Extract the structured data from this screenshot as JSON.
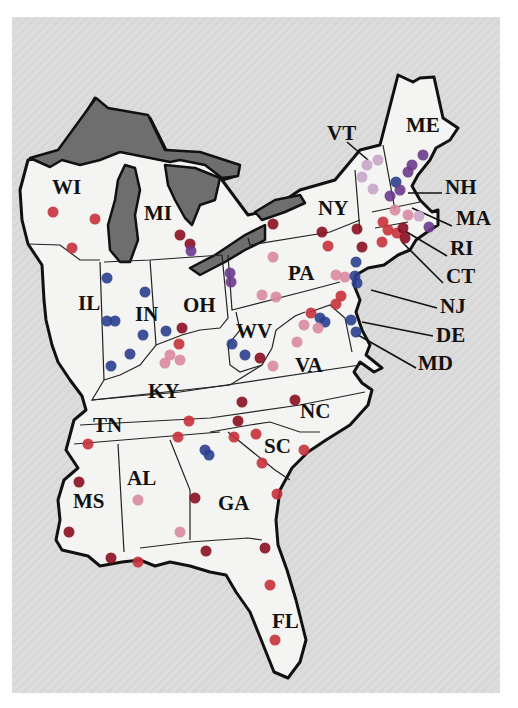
{
  "map": {
    "title": "",
    "region": "Eastern United States",
    "colors": {
      "background": "#d9d9d9",
      "land": "#f4f4f2",
      "lakes": "#6e6e6e",
      "outline": "#111111"
    },
    "dot_categories": [
      {
        "name": "dark-red",
        "color": "#8b1020"
      },
      {
        "name": "red",
        "color": "#c8313a"
      },
      {
        "name": "purple",
        "color": "#6a3a8c"
      },
      {
        "name": "blue",
        "color": "#2b3f8f"
      },
      {
        "name": "pink",
        "color": "#d98aa0"
      },
      {
        "name": "lavender",
        "color": "#c9a5c9"
      }
    ],
    "state_labels": [
      {
        "code": "WI",
        "x": 52,
        "y": 194
      },
      {
        "code": "MI",
        "x": 144,
        "y": 220
      },
      {
        "code": "VT",
        "x": 327,
        "y": 140
      },
      {
        "code": "ME",
        "x": 406,
        "y": 132
      },
      {
        "code": "NY",
        "x": 318,
        "y": 215
      },
      {
        "code": "NH",
        "x": 445,
        "y": 194
      },
      {
        "code": "MA",
        "x": 456,
        "y": 225
      },
      {
        "code": "PA",
        "x": 288,
        "y": 280
      },
      {
        "code": "RI",
        "x": 450,
        "y": 255
      },
      {
        "code": "CT",
        "x": 446,
        "y": 283
      },
      {
        "code": "IL",
        "x": 78,
        "y": 310
      },
      {
        "code": "IN",
        "x": 135,
        "y": 321
      },
      {
        "code": "OH",
        "x": 183,
        "y": 312
      },
      {
        "code": "NJ",
        "x": 440,
        "y": 313
      },
      {
        "code": "WV",
        "x": 236,
        "y": 338
      },
      {
        "code": "DE",
        "x": 436,
        "y": 342
      },
      {
        "code": "VA",
        "x": 295,
        "y": 372
      },
      {
        "code": "MD",
        "x": 418,
        "y": 370
      },
      {
        "code": "KY",
        "x": 148,
        "y": 398
      },
      {
        "code": "TN",
        "x": 93,
        "y": 432
      },
      {
        "code": "NC",
        "x": 300,
        "y": 418
      },
      {
        "code": "SC",
        "x": 264,
        "y": 453
      },
      {
        "code": "AL",
        "x": 127,
        "y": 485
      },
      {
        "code": "MS",
        "x": 73,
        "y": 508
      },
      {
        "code": "GA",
        "x": 218,
        "y": 510
      },
      {
        "code": "FL",
        "x": 272,
        "y": 628
      }
    ],
    "sites": [
      {
        "x": 53,
        "y": 212,
        "c": "#c8313a"
      },
      {
        "x": 95,
        "y": 219,
        "c": "#c8313a"
      },
      {
        "x": 72,
        "y": 248,
        "c": "#c8313a"
      },
      {
        "x": 180,
        "y": 235,
        "c": "#8b1020"
      },
      {
        "x": 190,
        "y": 244,
        "c": "#8b1020"
      },
      {
        "x": 191,
        "y": 251,
        "c": "#6a3a8c"
      },
      {
        "x": 107,
        "y": 278,
        "c": "#2b3f8f"
      },
      {
        "x": 145,
        "y": 292,
        "c": "#2b3f8f"
      },
      {
        "x": 107,
        "y": 321,
        "c": "#2b3f8f"
      },
      {
        "x": 115,
        "y": 321,
        "c": "#2b3f8f"
      },
      {
        "x": 143,
        "y": 335,
        "c": "#2b3f8f"
      },
      {
        "x": 166,
        "y": 331,
        "c": "#2b3f8f"
      },
      {
        "x": 130,
        "y": 354,
        "c": "#2b3f8f"
      },
      {
        "x": 111,
        "y": 366,
        "c": "#2b3f8f"
      },
      {
        "x": 182,
        "y": 328,
        "c": "#8b1020"
      },
      {
        "x": 179,
        "y": 344,
        "c": "#c8313a"
      },
      {
        "x": 170,
        "y": 355,
        "c": "#d98aa0"
      },
      {
        "x": 165,
        "y": 363,
        "c": "#d98aa0"
      },
      {
        "x": 180,
        "y": 360,
        "c": "#d98aa0"
      },
      {
        "x": 230,
        "y": 273,
        "c": "#6a3a8c"
      },
      {
        "x": 231,
        "y": 282,
        "c": "#6a3a8c"
      },
      {
        "x": 273,
        "y": 224,
        "c": "#8b1020"
      },
      {
        "x": 322,
        "y": 232,
        "c": "#8b1020"
      },
      {
        "x": 357,
        "y": 229,
        "c": "#8b1020"
      },
      {
        "x": 328,
        "y": 246,
        "c": "#c8313a"
      },
      {
        "x": 362,
        "y": 247,
        "c": "#8b1020"
      },
      {
        "x": 273,
        "y": 257,
        "c": "#d98aa0"
      },
      {
        "x": 262,
        "y": 295,
        "c": "#d98aa0"
      },
      {
        "x": 276,
        "y": 297,
        "c": "#d98aa0"
      },
      {
        "x": 336,
        "y": 275,
        "c": "#d98aa0"
      },
      {
        "x": 345,
        "y": 277,
        "c": "#d98aa0"
      },
      {
        "x": 355,
        "y": 276,
        "c": "#2b3f8f"
      },
      {
        "x": 356,
        "y": 262,
        "c": "#2b3f8f"
      },
      {
        "x": 357,
        "y": 283,
        "c": "#2b3f8f"
      },
      {
        "x": 341,
        "y": 296,
        "c": "#c8313a"
      },
      {
        "x": 367,
        "y": 165,
        "c": "#c9a5c9"
      },
      {
        "x": 378,
        "y": 160,
        "c": "#c9a5c9"
      },
      {
        "x": 362,
        "y": 177,
        "c": "#c9a5c9"
      },
      {
        "x": 373,
        "y": 189,
        "c": "#c9a5c9"
      },
      {
        "x": 423,
        "y": 155,
        "c": "#6a3a8c"
      },
      {
        "x": 412,
        "y": 165,
        "c": "#6a3a8c"
      },
      {
        "x": 408,
        "y": 172,
        "c": "#6a3a8c"
      },
      {
        "x": 396,
        "y": 182,
        "c": "#2b3f8f"
      },
      {
        "x": 400,
        "y": 190,
        "c": "#6a3a8c"
      },
      {
        "x": 390,
        "y": 196,
        "c": "#6a3a8c"
      },
      {
        "x": 395,
        "y": 210,
        "c": "#d98aa0"
      },
      {
        "x": 408,
        "y": 215,
        "c": "#d98aa0"
      },
      {
        "x": 419,
        "y": 216,
        "c": "#c9a5c9"
      },
      {
        "x": 429,
        "y": 227,
        "c": "#6a3a8c"
      },
      {
        "x": 383,
        "y": 222,
        "c": "#c8313a"
      },
      {
        "x": 388,
        "y": 230,
        "c": "#c8313a"
      },
      {
        "x": 397,
        "y": 233,
        "c": "#c8313a"
      },
      {
        "x": 403,
        "y": 228,
        "c": "#8b1020"
      },
      {
        "x": 405,
        "y": 238,
        "c": "#8b1020"
      },
      {
        "x": 382,
        "y": 242,
        "c": "#c8313a"
      },
      {
        "x": 311,
        "y": 313,
        "c": "#c8313a"
      },
      {
        "x": 320,
        "y": 318,
        "c": "#2b3f8f"
      },
      {
        "x": 325,
        "y": 322,
        "c": "#2b3f8f"
      },
      {
        "x": 351,
        "y": 320,
        "c": "#2b3f8f"
      },
      {
        "x": 356,
        "y": 332,
        "c": "#2b3f8f"
      },
      {
        "x": 336,
        "y": 304,
        "c": "#c8313a"
      },
      {
        "x": 304,
        "y": 325,
        "c": "#d98aa0"
      },
      {
        "x": 318,
        "y": 328,
        "c": "#d98aa0"
      },
      {
        "x": 297,
        "y": 342,
        "c": "#d98aa0"
      },
      {
        "x": 232,
        "y": 344,
        "c": "#2b3f8f"
      },
      {
        "x": 245,
        "y": 355,
        "c": "#2b3f8f"
      },
      {
        "x": 260,
        "y": 358,
        "c": "#8b1020"
      },
      {
        "x": 273,
        "y": 366,
        "c": "#d98aa0"
      },
      {
        "x": 242,
        "y": 402,
        "c": "#8b1020"
      },
      {
        "x": 295,
        "y": 400,
        "c": "#8b1020"
      },
      {
        "x": 238,
        "y": 421,
        "c": "#8b1020"
      },
      {
        "x": 189,
        "y": 421,
        "c": "#c8313a"
      },
      {
        "x": 178,
        "y": 437,
        "c": "#c8313a"
      },
      {
        "x": 88,
        "y": 444,
        "c": "#c8313a"
      },
      {
        "x": 256,
        "y": 434,
        "c": "#c8313a"
      },
      {
        "x": 234,
        "y": 437,
        "c": "#c8313a"
      },
      {
        "x": 205,
        "y": 450,
        "c": "#2b3f8f"
      },
      {
        "x": 209,
        "y": 455,
        "c": "#2b3f8f"
      },
      {
        "x": 304,
        "y": 450,
        "c": "#c8313a"
      },
      {
        "x": 262,
        "y": 463,
        "c": "#c8313a"
      },
      {
        "x": 277,
        "y": 494,
        "c": "#c8313a"
      },
      {
        "x": 79,
        "y": 482,
        "c": "#8b1020"
      },
      {
        "x": 138,
        "y": 500,
        "c": "#d98aa0"
      },
      {
        "x": 195,
        "y": 498,
        "c": "#8b1020"
      },
      {
        "x": 69,
        "y": 532,
        "c": "#8b1020"
      },
      {
        "x": 180,
        "y": 532,
        "c": "#d98aa0"
      },
      {
        "x": 206,
        "y": 551,
        "c": "#8b1020"
      },
      {
        "x": 265,
        "y": 548,
        "c": "#8b1020"
      },
      {
        "x": 111,
        "y": 558,
        "c": "#8b1020"
      },
      {
        "x": 138,
        "y": 562,
        "c": "#c8313a"
      },
      {
        "x": 270,
        "y": 585,
        "c": "#c8313a"
      },
      {
        "x": 275,
        "y": 640,
        "c": "#c8313a"
      }
    ]
  }
}
